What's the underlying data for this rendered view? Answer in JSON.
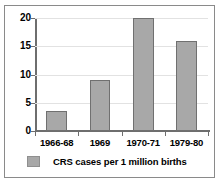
{
  "chart_data": {
    "type": "bar",
    "title": "",
    "xlabel": "",
    "ylabel": "",
    "categories": [
      "1966-68",
      "1969",
      "1970-71",
      "1979-80"
    ],
    "values": [
      3.5,
      9,
      20,
      16
    ],
    "series": [
      {
        "name": "CRS cases per 1 million births",
        "values": [
          3.5,
          9,
          20,
          16
        ]
      }
    ],
    "ylim": [
      0,
      20
    ],
    "yticks": [
      0,
      5,
      10,
      15,
      20
    ],
    "ytick_labels": [
      "0",
      "5",
      "10",
      "15",
      "20"
    ],
    "grid": true,
    "legend": {
      "position": "bottom",
      "entries": [
        {
          "label": "CRS cases per 1 million births",
          "color": "#a8a8a8"
        }
      ]
    },
    "colors": {
      "bar_fill": "#a8a8a8",
      "bar_stroke": "#707070",
      "axis": "#6e6e6e",
      "gridline": "#e2e2e2",
      "frame": "#8a8a8a",
      "text": "#000000",
      "background": "#ffffff"
    }
  }
}
